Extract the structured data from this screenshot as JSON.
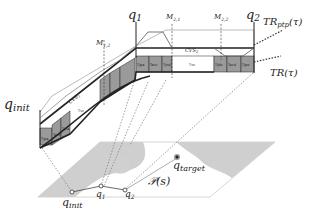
{
  "labels": {
    "q_init_top": "q",
    "q_init_top_sub": "init",
    "q1_top": "q",
    "q1_top_sub": "1",
    "q2_top": "q",
    "q2_top_sub": "2",
    "m12": "M",
    "m12_sub": "1,2",
    "m21": "M",
    "m21_sub": "2,1",
    "m22": "M",
    "m22_sub": "2,2",
    "cvs1": "CVS",
    "cvs1_sub": "1",
    "cvs2": "CVS",
    "cvs2_sub": "2",
    "tr_ptp": "TR",
    "tr_ptp_sub": "ptp",
    "tr_ptp_arg": "(τ)",
    "tr": "TR(τ)",
    "q_target": "q",
    "q_target_sub": "target",
    "path": "𝒫(s)",
    "q_init_bottom": "q",
    "q_init_bottom_sub": "init",
    "q1_bottom": "q",
    "q1_bottom_sub": "1",
    "q2_bottom": "q",
    "q2_bottom_sub": "2"
  },
  "segments": {
    "seg1": [
      "Tjpa",
      "Tacc",
      "Tjna"
    ],
    "seg1_vc": "Tvc",
    "seg1_dec": [
      "Tjnd",
      "Tdec",
      "Tjpd"
    ],
    "seg2": [
      "Tjpa",
      "Tacc",
      "Tjnd"
    ],
    "seg2_vc": "Tvc",
    "seg2_dec": [
      "Tjdo",
      "Tacd",
      "Tjpo"
    ]
  },
  "colors": {
    "shaded": "#9a9a9a",
    "obstacle": "#cfcfcf",
    "line": "#222222",
    "light_line": "#aaaaaa"
  }
}
